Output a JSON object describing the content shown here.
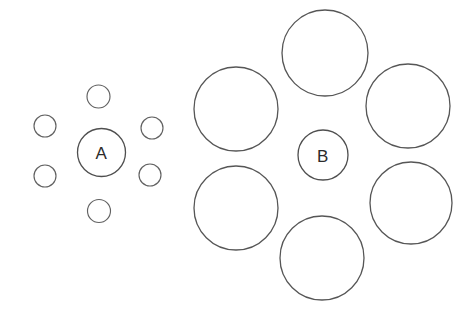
{
  "figure": {
    "background_color": "#ffffff",
    "stroke_color": "#5a5a5a",
    "label_color": "#2b2b2b",
    "width": 473,
    "height": 320
  },
  "chart_data": {
    "type": "scatter",
    "xlabel": "",
    "ylabel": "",
    "xlim": [
      0,
      473
    ],
    "ylim": [
      0,
      320
    ],
    "grid": false,
    "legend": "none",
    "annotations": [
      "A",
      "B"
    ],
    "groups": [
      {
        "name": "left-cluster",
        "target": {
          "label": "A",
          "cx": 101.5,
          "cy": 152.5,
          "r": 24
        },
        "inducers": [
          {
            "cx": 98.5,
            "cy": 96.5,
            "r": 11.5
          },
          {
            "cx": 45.0,
            "cy": 126.0,
            "r": 11.0
          },
          {
            "cx": 45.0,
            "cy": 176.0,
            "r": 11.0
          },
          {
            "cx": 152.0,
            "cy": 128.0,
            "r": 11.0
          },
          {
            "cx": 150.0,
            "cy": 175.0,
            "r": 11.0
          },
          {
            "cx": 99.0,
            "cy": 211.0,
            "r": 11.5
          }
        ]
      },
      {
        "name": "right-cluster",
        "target": {
          "label": "B",
          "cx": 323.0,
          "cy": 155.0,
          "r": 25
        },
        "inducers": [
          {
            "cx": 325.0,
            "cy": 53.0,
            "r": 43.0
          },
          {
            "cx": 236.0,
            "cy": 109.0,
            "r": 42.0
          },
          {
            "cx": 236.0,
            "cy": 208.0,
            "r": 42.0
          },
          {
            "cx": 408.0,
            "cy": 106.0,
            "r": 42.0
          },
          {
            "cx": 411.0,
            "cy": 203.0,
            "r": 41.0
          },
          {
            "cx": 322.0,
            "cy": 258.0,
            "r": 42.0
          }
        ]
      }
    ]
  },
  "labels": {
    "left_target": "A",
    "right_target": "B"
  }
}
